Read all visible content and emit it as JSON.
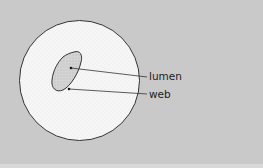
{
  "diagram": {
    "title": "",
    "background_color": "#c9c9c9",
    "labels": {
      "lumen": "lumen",
      "web": "web"
    },
    "colors": {
      "cell_fill": "#f6f6f6",
      "lumen_fill": "#d2d2d2",
      "outline": "#333333"
    }
  }
}
